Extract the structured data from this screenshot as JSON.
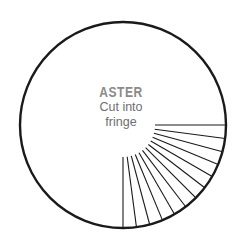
{
  "canvas": {
    "width": 242,
    "height": 245,
    "background": "#ffffff"
  },
  "labels": {
    "flower_name": "ASTER",
    "instruction_line_1": "Cut into",
    "instruction_line_2": "fringe",
    "name_color": "#8a8a8a",
    "instruction_color": "#6e6e6e"
  },
  "diagram": {
    "shape": "circle",
    "stroke_color": "#1a1a1a",
    "fill_color": "#ffffff",
    "outline_stroke_width": 2.4,
    "fringe_stroke_width": 1.1,
    "center_x": 123,
    "center_y": 125,
    "outer_radius": 103,
    "inner_radius": 32,
    "fringe_line_count": 13,
    "fringe_start_angle_deg": 0,
    "fringe_end_angle_deg": 90,
    "fringe_angle_step_deg": 7.5,
    "fringe_angles_deg": [
      0,
      7.5,
      15,
      22.5,
      30,
      37.5,
      45,
      52.5,
      60,
      67.5,
      75,
      82.5,
      90
    ]
  }
}
